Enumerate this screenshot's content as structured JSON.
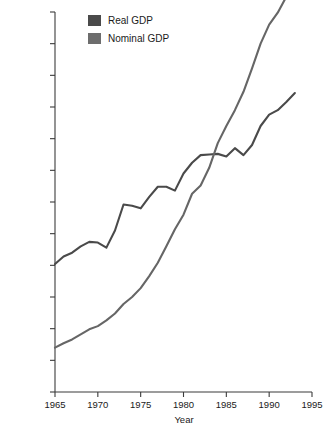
{
  "chart_data": {
    "type": "line",
    "title": "",
    "xlabel": "Year",
    "ylabel": "Nominal and Real Annual GDP (trillions)",
    "xlim": [
      1965,
      1995
    ],
    "ylim": [
      0,
      6.0
    ],
    "grid": false,
    "legend_position": "top-left-inside",
    "xticks": [
      "1965",
      "1970",
      "1975",
      "1980",
      "1985",
      "1990",
      "1995"
    ],
    "xtick_values": [
      1965,
      1970,
      1975,
      1980,
      1985,
      1990,
      1995
    ],
    "yticks": [
      "0",
      "$.5",
      "$1.0",
      "$1.5",
      "$2.0",
      "$2.5",
      "$3.0",
      "$3.5",
      "$4.0",
      "$4.5",
      "$5.0",
      "$5.5",
      "$6.0"
    ],
    "ytick_values": [
      0,
      0.5,
      1.0,
      1.5,
      2.0,
      2.5,
      3.0,
      3.5,
      4.0,
      4.5,
      5.0,
      5.5,
      6.0
    ],
    "x": [
      1965,
      1966,
      1967,
      1968,
      1969,
      1970,
      1971,
      1972,
      1973,
      1974,
      1975,
      1976,
      1977,
      1978,
      1979,
      1980,
      1981,
      1982,
      1983,
      1984,
      1985,
      1986,
      1987,
      1988,
      1989,
      1990,
      1991,
      1992,
      1993
    ],
    "series": [
      {
        "name": "Real GDP",
        "color": "#4a4a4a",
        "values": [
          2.02,
          2.14,
          2.2,
          2.3,
          2.37,
          2.36,
          2.28,
          2.55,
          2.96,
          2.94,
          2.9,
          3.08,
          3.24,
          3.24,
          3.18,
          3.45,
          3.62,
          3.74,
          3.75,
          3.76,
          3.72,
          3.85,
          3.74,
          3.9,
          4.2,
          4.38,
          4.45,
          4.58,
          4.72
        ]
      },
      {
        "name": "Nominal GDP",
        "color": "#666666",
        "values": [
          0.7,
          0.77,
          0.83,
          0.91,
          0.99,
          1.04,
          1.13,
          1.24,
          1.39,
          1.5,
          1.64,
          1.83,
          2.04,
          2.3,
          2.57,
          2.8,
          3.13,
          3.26,
          3.54,
          3.93,
          4.2,
          4.45,
          4.74,
          5.11,
          5.5,
          5.8,
          5.99,
          6.24,
          6.35
        ]
      }
    ]
  },
  "legend": {
    "items": [
      {
        "label": "Real GDP",
        "color": "#4a4a4a"
      },
      {
        "label": "Nominal GDP",
        "color": "#6d6d6d"
      }
    ]
  },
  "axes": {
    "y_title": "Nominal and Real Annual GDP (trillions)",
    "x_title": "Year"
  }
}
